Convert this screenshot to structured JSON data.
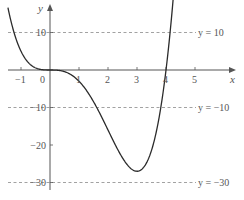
{
  "chart_data": {
    "type": "line",
    "title": "",
    "function": "y = x^4 - 4x^3",
    "xlabel": "x",
    "ylabel": "y",
    "xlim": [
      -1.45,
      4.3
    ],
    "ylim": [
      -32,
      18
    ],
    "x_ticks": [
      -1,
      0,
      1,
      2,
      3,
      4,
      5
    ],
    "x_tick_labels": [
      "−1",
      "0",
      "1",
      "2",
      "3",
      "4",
      "5"
    ],
    "y_ticks": [
      10,
      -10,
      -20,
      -30
    ],
    "y_tick_labels": [
      "10",
      "−10",
      "−20",
      "−30"
    ],
    "grid": false,
    "reference_lines": [
      {
        "y": 10,
        "label": "y = 10",
        "style": "dashed"
      },
      {
        "y": -10,
        "label": "y = −10",
        "style": "dashed"
      },
      {
        "y": -30,
        "label": "y = −30",
        "style": "dashed"
      }
    ],
    "series": [
      {
        "name": "y = x^4 - 4x^3",
        "x": [
          -1.45,
          -1.25,
          -1,
          -0.75,
          -0.5,
          -0.25,
          0,
          0.5,
          1,
          1.5,
          2,
          2.5,
          3,
          3.5,
          4,
          4.25
        ],
        "values": [
          18.6,
          10.2,
          5,
          2.0,
          0.56,
          0.07,
          0,
          -0.44,
          -3,
          -8.44,
          -16,
          -23.44,
          -27,
          -21.44,
          0,
          19.5
        ]
      }
    ],
    "key_points": [
      {
        "x": 0,
        "y": 0,
        "note": "stationary point of inflection"
      },
      {
        "x": 3,
        "y": -27,
        "note": "minimum"
      },
      {
        "x": 4,
        "y": 0,
        "note": "root"
      }
    ],
    "colors": {
      "curve": "#2b2b2b",
      "axes": "#555555",
      "dashed": "#8a8a8a",
      "text": "#555555"
    }
  }
}
